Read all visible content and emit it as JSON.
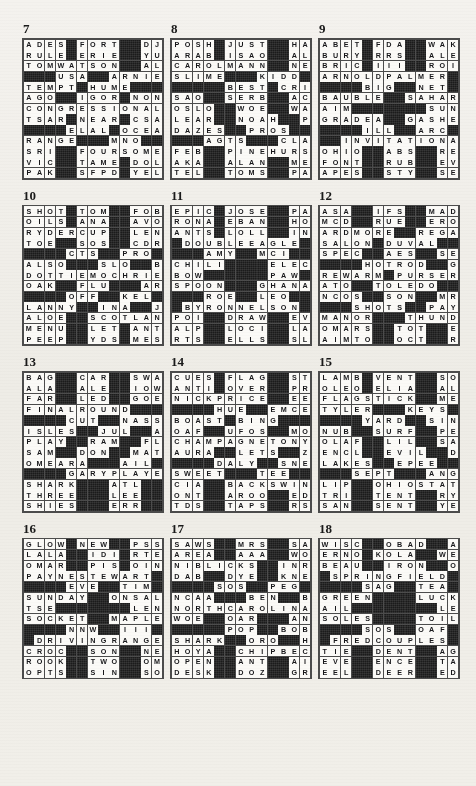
{
  "page": {
    "background_color": "#f2f0ec",
    "block_color": "#1b1b1b",
    "cell_color": "#fbfaf7",
    "grid_size": 13,
    "columns_per_row": 3,
    "rows_of_puzzles": 4
  },
  "legend": {
    "block_char": "#",
    "letter_chars": "A-Z"
  },
  "puzzles": [
    {
      "number": "7",
      "rows": [
        "ADES#FORT##DJS",
        "RULE#ERIE##YUM",
        "TOMWATSON##ALE",
        "###USA##ARNIE#",
        "TEMPT#HUME####",
        "AGO##IGOR#NONE",
        "CONGRESSIONAL#",
        "TSAR#NEAR#CSA#",
        "####ELAL#OCEAN",
        "RANGE###MNO###",
        "SRI##FOURSOMES",
        "VIC##TAME#DOLT",
        "PAK##SFPD#YELP"
      ]
    },
    {
      "number": "8",
      "rows": [
        "POSH#JUST##HAL",
        "ARAB#ISAO##ALI",
        "CAROLMANN##NEE",
        "SLIME###KIDD##",
        "#####BEST#CRIME",
        "SAO##SERB##ACED",
        "OSLO##WOE##WARN",
        "LEAR##NOAH##PEA",
        "DAZES##PROS####",
        "###AGTS###CLAUS",
        "FEB##PINEHURST",
        "AKA##ALAN##MEGA",
        "TEL##TOMS##PAAR"
      ]
    },
    {
      "number": "9",
      "rows": [
        "ABET#FDA##WAKE",
        "BURY#RRS##ALEE",
        "BRIC#III##ROIL",
        "ARNOLDPALMER##",
        "####BIG##NET##",
        "BAUBLE##SAHARA",
        "AIM#######SUN#",
        "GRADEA##GASHES",
        "####ILL##ARC##",
        "##INVITATIONAL",
        "OHIO##ABS##RENO",
        "FONT##RUB##EVES",
        "APES##STY##SEWS"
      ]
    },
    {
      "number": "10",
      "rows": [
        "SHOT#TOM##FOBS",
        "OILS#ANA##AVOW",
        "RYDERCUP##LENA",
        "TOE##SOS##CDROM",
        "####CTS##PRO###",
        "ALSO###SLO##BAH",
        "DOTTIEMOCHRIE",
        "OAK##FLU###ARMY",
        "####OFF##KEL###",
        "LANNY##INA##JAI",
        "ALOE##SCOTLAND",
        "MENU##LET#ANTE",
        "PEEP##YDS#MESA"
      ]
    },
    {
      "number": "11",
      "rows": [
        "EPIC#JOSE##PAT",
        "RONA#EBAN##HOE",
        "ANTS#LOLL##INN",
        "#DOUBLEEAGLE##",
        "###AMY##MCI###",
        "CHILI####ELECT",
        "BOW######PAW##",
        "SPOON###GHANA#",
        "###ROE##LEO###",
        "#BYRONNELSON#",
        "POI##DRAW##EVEN",
        "ALP##LOCI##LARA",
        "RTS##ELLS##SLOT"
      ]
    },
    {
      "number": "12",
      "rows": [
        "ASA##IFS##MADAM",
        "MCD##RUE##ERODE",
        "ARDMORE##REGAL",
        "SALON#DUVAL###",
        "SPEC##AES##SERI",
        "####HOTROD##GTE",
        "REWARM#PURSER",
        "ATO##TOLEDO###",
        "NCOS##SON##MRED",
        "###SHOTS##PAYNE",
        "MANOR###THUNDER",
        "OMARS##TOT##ERR",
        "AIMTO##OCT##ROY"
      ]
    },
    {
      "number": "13",
      "rows": [
        "BAG##CAR##SWAMI",
        "ALA##ALE##IOWAN",
        "FAR##LED##GOERS",
        "FINALROUND####",
        "####CUT##NASSAU",
        "ISLES##JUL##ALT",
        "PLAY##RAM##FLEA",
        "SAM##DON##MATCH",
        "OMEARA###AIL###",
        "####GARYPLAYER",
        "SHARK###ATL##ONO",
        "THREE###LEE##YDS",
        "SHIES###ERR##OSS"
      ]
    },
    {
      "number": "14",
      "rows": [
        "CUES#FLAG##STS",
        "ANTI#OVER##PRO",
        "NICKPRICE##EEL",
        "####HUE##EMCEE",
        "BOAST#BING####",
        "OAF##UFOS##MOOD",
        "CHAMPAGNETONY",
        "AURA##LETS##ZEE",
        "####DALY##SNEAD",
        "SWEET###TEE####",
        "CIA##BACKSWING",
        "ONT##AROO##EDEN",
        "TDS##TAPS##RSVP"
      ]
    },
    {
      "number": "15",
      "rows": [
        "LAMB#VENT##SOS",
        "OLEO#ELIA##ALA",
        "FLAGSTICK##MEL",
        "TYLER###KEYS##",
        "####YARD##SINGH",
        "NUB##SURF##PELE",
        "OLAF##LIL##SAUL",
        "ENCL##EVIL##DEM",
        "LAKES##EPEE####",
        "###SEPT###ANGEL",
        "LIP##OHIOSTATE",
        "TRI##TENT##RYNE",
        "SAN##SENT##YEAR"
      ]
    },
    {
      "number": "16",
      "rows": [
        "GLOW#NEW##PSST",
        "LALA##IDI#RTES",
        "OMAR##PIS#OINK",
        "PAYNESTEWART#",
        "####EVE##TIM###",
        "SUNDAY##ONSALE",
        "TSE#######LEN##",
        "SOCKET##MAPLES",
        "####NNW##III###",
        "#DRIVINGRANGE",
        "CROC##SON##NEAT",
        "ROOK##TWO##OMIT",
        "OPTS##SIN##SOLE"
      ]
    },
    {
      "number": "17",
      "rows": [
        "SAWS##MRS##SAGO",
        "AREA##AAA##WOOD",
        "NIBLICKS##INRE",
        "DAB##DYE##KNEES",
        "####SOS##PEG###",
        "NCAA###BEN##BAD",
        "NORTHCAROLINA",
        "WOE##OAR###ANDY",
        "#####POP##BOB##",
        "SHARK##ORO##HAS",
        "HOYA##CHIPBECK",
        "OPEN##ANT##AIRE",
        "DESK##DOZ##GREW"
      ]
    },
    {
      "number": "18",
      "rows": [
        "WISC##OBAD##AHA",
        "ERNO#KOLA##WET",
        "BEAU##IRON##OAT",
        "#SPRINGFIELD##",
        "####SAG##TEA###",
        "GREEN####LUCKY",
        "AIL########LED",
        "SOLES####TOILS",
        "####SOS##OAF###",
        "#FREDCOUPLES",
        "TIE##DENT##AGES",
        "EVE##ENCE##TAVI",
        "EEL##DEER##EDEN"
      ]
    }
  ]
}
